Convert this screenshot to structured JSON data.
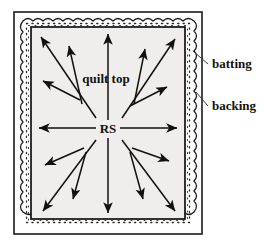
{
  "figure": {
    "name": "quilt-layers-diagram",
    "background_color": "#ffffff"
  },
  "colors": {
    "ink": "#111111",
    "quilt_top_fill": "#efeeec",
    "backing_fill": "#ffffff",
    "batting_fill": "#ffffff",
    "outline": "#1a1a1a"
  },
  "labels": {
    "quilt_top": "quilt top",
    "right_side": "RS",
    "batting": "batting",
    "backing": "backing"
  },
  "label_positions": {
    "quilt_top": {
      "x": 106,
      "y": 83
    },
    "right_side": {
      "x": 101,
      "y": 133
    },
    "batting": {
      "x": 212,
      "y": 68
    },
    "backing": {
      "x": 212,
      "y": 110
    }
  },
  "leader_lines": [
    {
      "name": "batting-leader",
      "x1": 208,
      "y1": 64,
      "x2": 193,
      "y2": 52
    },
    {
      "name": "backing-leader",
      "x1": 208,
      "y1": 106,
      "x2": 195,
      "y2": 93
    }
  ],
  "layers": [
    {
      "name": "backing",
      "shape": "rect",
      "x": 14,
      "y": 12,
      "width": 188,
      "height": 222
    },
    {
      "name": "batting",
      "shape": "wavy-rect",
      "x": 22,
      "y": 19,
      "width": 172,
      "height": 208
    },
    {
      "name": "quilt-top",
      "shape": "rect",
      "x": 31,
      "y": 27,
      "width": 154,
      "height": 192
    }
  ],
  "center": {
    "x": 108,
    "y": 128
  },
  "arrows": [
    {
      "name": "arrow-up",
      "x1": 108,
      "y1": 120,
      "x2": 108,
      "y2": 33
    },
    {
      "name": "arrow-down",
      "x1": 108,
      "y1": 138,
      "x2": 108,
      "y2": 214
    },
    {
      "name": "arrow-left",
      "x1": 96,
      "y1": 128,
      "x2": 38,
      "y2": 128
    },
    {
      "name": "arrow-right",
      "x1": 120,
      "y1": 128,
      "x2": 178,
      "y2": 128
    },
    {
      "name": "arrow-up-left-long",
      "x1": 96,
      "y1": 118,
      "x2": 40,
      "y2": 36
    },
    {
      "name": "arrow-up-right-long",
      "x1": 122,
      "y1": 118,
      "x2": 176,
      "y2": 38
    },
    {
      "name": "arrow-down-left-long",
      "x1": 96,
      "y1": 140,
      "x2": 42,
      "y2": 212
    },
    {
      "name": "arrow-down-right-long",
      "x1": 122,
      "y1": 140,
      "x2": 176,
      "y2": 212
    },
    {
      "name": "arrow-up-left-steep",
      "x1": 82,
      "y1": 104,
      "x2": 68,
      "y2": 45
    },
    {
      "name": "arrow-up-right-steep",
      "x1": 134,
      "y1": 104,
      "x2": 146,
      "y2": 48
    },
    {
      "name": "arrow-up-left-shallow",
      "x1": 80,
      "y1": 100,
      "x2": 42,
      "y2": 80
    },
    {
      "name": "arrow-up-right-shallow",
      "x1": 130,
      "y1": 106,
      "x2": 168,
      "y2": 86
    },
    {
      "name": "arrow-down-left-steep",
      "x1": 86,
      "y1": 152,
      "x2": 72,
      "y2": 200
    },
    {
      "name": "arrow-down-right-steep",
      "x1": 130,
      "y1": 152,
      "x2": 144,
      "y2": 200
    },
    {
      "name": "arrow-down-left-shallow",
      "x1": 84,
      "y1": 148,
      "x2": 44,
      "y2": 166
    },
    {
      "name": "arrow-down-right-shallow",
      "x1": 132,
      "y1": 148,
      "x2": 170,
      "y2": 162
    }
  ]
}
